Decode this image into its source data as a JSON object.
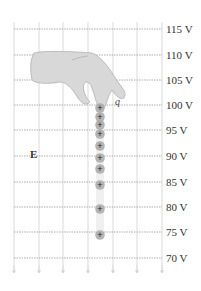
{
  "diagram": {
    "field_label": "E",
    "charge_label": "q",
    "equipotential_labels": [
      "115 V",
      "110 V",
      "105 V",
      "100 V",
      "95 V",
      "90 V",
      "85 V",
      "80 V",
      "75 V",
      "70 V"
    ],
    "equipotential_y": [
      29,
      55,
      80,
      105,
      130,
      156,
      182,
      207,
      232,
      258
    ],
    "grid_x": [
      14,
      39,
      63,
      88,
      113,
      137,
      162
    ],
    "charge_positions_y": [
      108,
      117,
      125,
      134,
      146,
      158,
      169,
      185,
      209,
      235
    ],
    "charge_x": 100,
    "charge_symbol": "+",
    "colors": {
      "grid": "#d0d0d0",
      "equipotential": "#9a9a9a",
      "charge_fill": "#a8a8a8",
      "hand_fill": "#d8d8d8",
      "hand_stroke": "#b0b0b0",
      "text": "#333333"
    }
  }
}
